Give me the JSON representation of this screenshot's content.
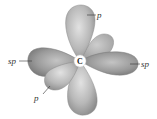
{
  "diagram": {
    "center_atom": "C",
    "labels": {
      "p_top": "p",
      "sp_left": "sp",
      "sp_right": "sp",
      "p_front": "p"
    },
    "colors": {
      "lobe_fill": "#a8a8a8",
      "lobe_light": "#d6d6d6",
      "lobe_dark": "#7e7e7e",
      "label": "#333333",
      "background": "#ffffff"
    }
  }
}
